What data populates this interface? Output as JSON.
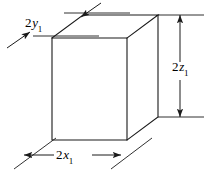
{
  "figure": {
    "type": "3d-box-dimension-diagram",
    "background_color": "#ffffff",
    "line_color": "#1a1a1a",
    "labels": {
      "width": {
        "number": "2",
        "variable": "x",
        "subscript": "1",
        "text": "2x1",
        "position": "bottom"
      },
      "depth": {
        "number": "2",
        "variable": "y",
        "subscript": "1",
        "text": "2y1",
        "position": "top-left"
      },
      "height": {
        "number": "2",
        "variable": "z",
        "subscript": "1",
        "text": "2z1",
        "position": "right"
      }
    },
    "geometry": {
      "front_face": {
        "top_left": [
          52,
          38
        ],
        "top_right": [
          127,
          38
        ],
        "bottom_right": [
          127,
          140
        ],
        "bottom_left": [
          52,
          140
        ]
      },
      "back_offset": [
        31,
        -23
      ],
      "back_top_left": [
        83,
        15
      ],
      "back_top_right": [
        158,
        15
      ],
      "back_bottom_right": [
        158,
        117
      ]
    },
    "dimension_lines": {
      "height_line_x": 180,
      "height_top_y": 15,
      "height_bottom_y": 117,
      "width_line_y": 155,
      "width_left_x": 24,
      "width_right_x": 121
    }
  }
}
